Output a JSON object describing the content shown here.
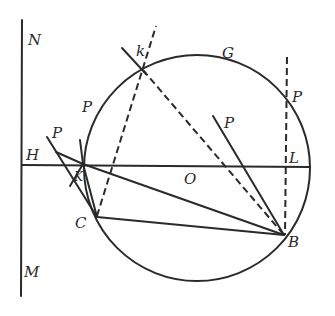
{
  "diagram": {
    "type": "geometry-construction",
    "labels": {
      "N": "N",
      "M": "M",
      "H": "H",
      "K": "K",
      "k": "k",
      "G": "G",
      "P_upper_left": "P",
      "P_left": "P",
      "P_center": "P",
      "P_right": "P",
      "L": "L",
      "O": "O",
      "C": "C",
      "B": "B"
    },
    "colors": {
      "ink": "#2a2a2a",
      "background": "#ffffff"
    },
    "elements": [
      "vertical line NM",
      "horizontal line HL through center O",
      "circle centered at O",
      "dashed vertical line through P and L to B",
      "dashed line from C through k",
      "dashed line from k to B",
      "line P to B",
      "line K to B",
      "line C to B",
      "line K to C",
      "line from P through H region to C",
      "short line segment through k"
    ]
  }
}
